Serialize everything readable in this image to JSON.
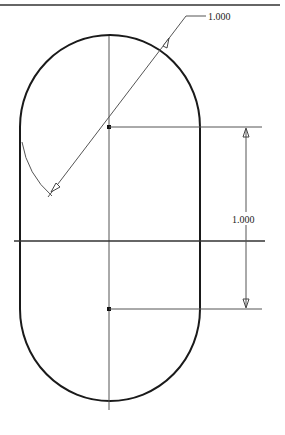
{
  "drawing": {
    "type": "technical-sketch-slot",
    "shape": "obround (stadium) slot",
    "dimensions": {
      "radius_label": "1.000",
      "center_distance_label": "1.000"
    },
    "colors": {
      "outline": "#1a1a1a",
      "construction": "#555555",
      "background": "#ffffff"
    }
  }
}
